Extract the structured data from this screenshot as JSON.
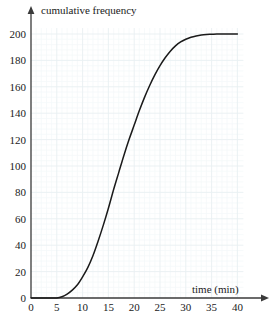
{
  "chart_data": {
    "type": "line",
    "title": "",
    "xlabel": "time (min)",
    "ylabel": "cumulative frequency",
    "xlim": [
      0,
      40
    ],
    "ylim": [
      0,
      200
    ],
    "xticks": [
      0,
      5,
      10,
      15,
      20,
      25,
      30,
      35,
      40
    ],
    "xtick_labels": [
      "0",
      "5",
      "10",
      "15",
      "20",
      "25",
      "30",
      "35",
      "40"
    ],
    "yticks": [
      0,
      20,
      40,
      60,
      80,
      100,
      120,
      140,
      160,
      180,
      200
    ],
    "ytick_labels": [
      "0",
      "20",
      "40",
      "60",
      "80",
      "100",
      "120",
      "140",
      "160",
      "180",
      "200"
    ],
    "grid": true,
    "grid_major_step_x": 5,
    "grid_minor_step_x": 1,
    "grid_major_step_y": 20,
    "grid_minor_step_y": 4,
    "legend": "none",
    "series": [
      {
        "name": "cumulative frequency",
        "color": "#1a1a1a",
        "x": [
          0,
          2,
          4,
          5,
          6,
          7,
          8,
          9,
          10,
          11,
          12,
          13,
          14,
          15,
          16,
          17,
          18,
          19,
          20,
          21,
          22,
          23,
          24,
          25,
          26,
          27,
          28,
          29,
          30,
          31,
          32,
          33,
          34,
          35,
          36,
          37,
          38,
          39,
          40
        ],
        "y": [
          0,
          0,
          0,
          0,
          1,
          3,
          6,
          10,
          16,
          23,
          32,
          43,
          55,
          68,
          82,
          95,
          108,
          120,
          131,
          142,
          152,
          161,
          169,
          176,
          182,
          187,
          191,
          194,
          196,
          197.5,
          198.5,
          199.2,
          199.6,
          199.8,
          200,
          200,
          200,
          200,
          200
        ]
      }
    ]
  },
  "axes": {
    "x_axis_label": "time (min)",
    "y_axis_label": "cumulative frequency"
  },
  "colors": {
    "curve": "#1a1a1a",
    "axis": "#3a3a3a",
    "grid_major": "#e9eff2",
    "grid_minor": "#f4f8f9",
    "text": "#1a1a1a",
    "background": "#ffffff"
  }
}
